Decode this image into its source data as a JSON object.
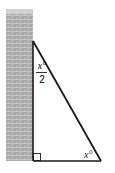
{
  "diagram": {
    "top_angle": {
      "numerator": "x°",
      "denominator": "2"
    },
    "bottom_angle": {
      "label": "x°"
    },
    "right_angle_marker": true,
    "colors": {
      "wall": "#a9a9a9",
      "wall_cap": "#cfcfcf",
      "mortar": "#d6d6d6",
      "line": "#1a1a1a"
    }
  }
}
